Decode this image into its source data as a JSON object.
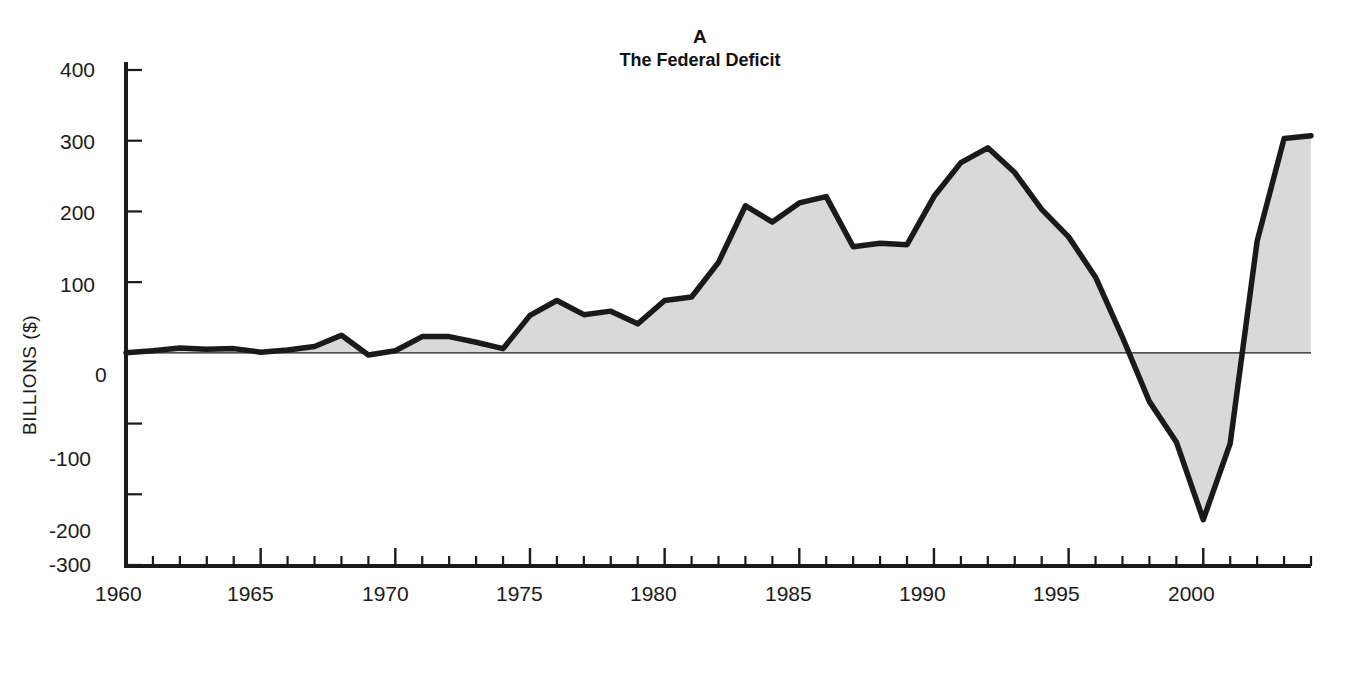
{
  "figure": {
    "panel_letter": "A",
    "panel_title": "The Federal Deficit",
    "background_color": "#ffffff"
  },
  "chart_data": {
    "type": "area",
    "title": "The Federal Deficit",
    "subtitle": "A",
    "xlabel": "",
    "ylabel": "BILLIONS ($)",
    "xlim": [
      1960,
      2004
    ],
    "ylim": [
      -300,
      400
    ],
    "grid": false,
    "legend": null,
    "series_fill_color": "#d9d9d9",
    "series_line_color": "#1a1a1a",
    "zero_line": 0,
    "x": [
      1960,
      1961,
      1962,
      1963,
      1964,
      1965,
      1966,
      1967,
      1968,
      1969,
      1970,
      1971,
      1972,
      1973,
      1974,
      1975,
      1976,
      1977,
      1978,
      1979,
      1980,
      1981,
      1982,
      1983,
      1984,
      1985,
      1986,
      1987,
      1988,
      1989,
      1990,
      1991,
      1992,
      1993,
      1994,
      1995,
      1996,
      1997,
      1998,
      1999,
      2000,
      2001,
      2002,
      2003,
      2004
    ],
    "values": [
      0,
      3,
      7,
      5,
      6,
      1,
      4,
      9,
      25,
      -3,
      3,
      23,
      23,
      15,
      6,
      53,
      74,
      54,
      59,
      41,
      74,
      79,
      128,
      208,
      185,
      212,
      221,
      150,
      155,
      153,
      221,
      269,
      290,
      255,
      203,
      164,
      107,
      22,
      -69,
      -126,
      -236,
      -128,
      158,
      303,
      307
    ],
    "yticks": [
      -300,
      -200,
      -100,
      0,
      100,
      200,
      300,
      400
    ],
    "ytick_labels": [
      "-300",
      "-200",
      "-100",
      "0",
      "100",
      "200",
      "300",
      "400"
    ],
    "xticks_major": [
      1960,
      1965,
      1970,
      1975,
      1980,
      1985,
      1990,
      1995,
      2000
    ],
    "xtick_labels": [
      "1960",
      "1965",
      "1970",
      "1975",
      "1980",
      "1985",
      "1990",
      "1995",
      "2000"
    ],
    "xticks_minor_step": 1
  },
  "axes": {
    "y_axis_title": "BILLIONS ($)",
    "y_tick_0": "400",
    "y_tick_1": "300",
    "y_tick_2": "200",
    "y_tick_3": "100",
    "y_tick_4": "0",
    "y_tick_5": "-100",
    "y_tick_6": "-200",
    "y_tick_7": "-300",
    "x_tick_0": "1960",
    "x_tick_1": "1965",
    "x_tick_2": "1970",
    "x_tick_3": "1975",
    "x_tick_4": "1980",
    "x_tick_5": "1985",
    "x_tick_6": "1990",
    "x_tick_7": "1995",
    "x_tick_8": "2000"
  }
}
